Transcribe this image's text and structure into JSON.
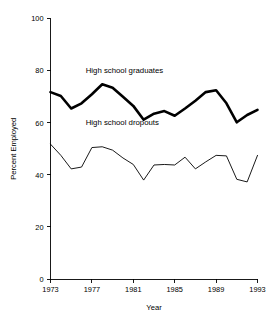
{
  "chart_data": {
    "type": "line",
    "title": "",
    "xlabel": "Year",
    "ylabel": "Percent Employed",
    "xlim": [
      1973,
      1993
    ],
    "ylim": [
      0,
      100
    ],
    "xticks": [
      1973,
      1977,
      1981,
      1985,
      1989,
      1993
    ],
    "yticks": [
      0,
      20,
      40,
      60,
      80,
      100
    ],
    "grid": false,
    "legend_position": "inline-annotation",
    "x": [
      1973,
      1974,
      1975,
      1976,
      1977,
      1978,
      1979,
      1980,
      1981,
      1982,
      1983,
      1984,
      1985,
      1986,
      1987,
      1988,
      1989,
      1990,
      1991,
      1992,
      1993
    ],
    "series": [
      {
        "name": "High school graduates",
        "color": "#000000",
        "line_width": 2.6,
        "values": [
          71.8,
          70.3,
          65.5,
          67.5,
          71.0,
          74.8,
          73.5,
          70.0,
          66.5,
          61.2,
          63.5,
          64.5,
          62.7,
          65.5,
          68.5,
          71.8,
          72.5,
          67.5,
          60.2,
          63.0,
          65.0
        ]
      },
      {
        "name": "High school dropouts",
        "color": "#000000",
        "line_width": 0.9,
        "values": [
          51.8,
          47.5,
          42.3,
          43.0,
          50.5,
          50.8,
          49.5,
          46.5,
          44.0,
          38.0,
          43.8,
          44.0,
          43.8,
          46.8,
          42.3,
          45.0,
          47.5,
          47.3,
          38.3,
          37.3,
          47.5
        ]
      }
    ],
    "annotations": [
      {
        "text": "High school graduates",
        "x": 1976.4,
        "y": 79.0
      },
      {
        "text": "High school dropouts",
        "x": 1976.4,
        "y": 59.0
      }
    ]
  }
}
